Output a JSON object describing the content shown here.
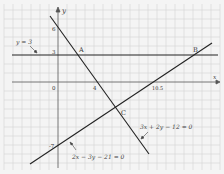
{
  "diagram": {
    "type": "coordinate-graph",
    "axes": {
      "x_label": "x",
      "y_label": "y",
      "origin_label": "0"
    },
    "tick_labels": {
      "x": [
        "4",
        "10.5"
      ],
      "y": [
        "6",
        "3",
        "-7"
      ]
    },
    "lines": [
      {
        "id": "line-y3",
        "equation": "y = 3"
      },
      {
        "id": "line-1",
        "equation": "3x + 2y − 12 = 0"
      },
      {
        "id": "line-2",
        "equation": "2x − 3y − 21 = 0"
      }
    ],
    "points": [
      {
        "label": "A",
        "x": 2,
        "y": 3
      },
      {
        "label": "B",
        "x": 15,
        "y": 3
      },
      {
        "label": "C",
        "x": 6,
        "y": -3
      }
    ],
    "colors": {
      "line": "#222222",
      "grid": "#d0d0d0",
      "background": "#f4f4f4"
    }
  }
}
